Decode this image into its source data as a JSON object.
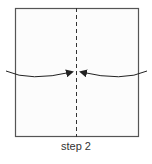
{
  "diagram": {
    "caption": "step 2",
    "colors": {
      "outline": "#555555",
      "fill": "#fcfcfc",
      "arrow": "#222222"
    },
    "elements": [
      "paper-square",
      "center-fold-line-dashed",
      "left-arrow",
      "right-arrow"
    ]
  }
}
